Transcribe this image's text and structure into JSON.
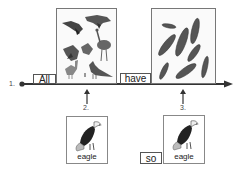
{
  "timeline": {
    "start_marker": "1.",
    "words": [
      {
        "text": "All"
      },
      {
        "text": "have"
      }
    ],
    "pointers": [
      {
        "label": "2."
      },
      {
        "label": "3."
      }
    ]
  },
  "images": {
    "birds": {
      "icon": "birds-collection-icon"
    },
    "feathers": {
      "icon": "feathers-collection-icon"
    }
  },
  "cards": [
    {
      "label": "eagle",
      "icon": "eagle-icon"
    },
    {
      "label": "eagle",
      "icon": "eagle-icon"
    }
  ],
  "extra_words": [
    {
      "text": "so"
    }
  ],
  "colors": {
    "line": "#333333",
    "border": "#777777"
  }
}
